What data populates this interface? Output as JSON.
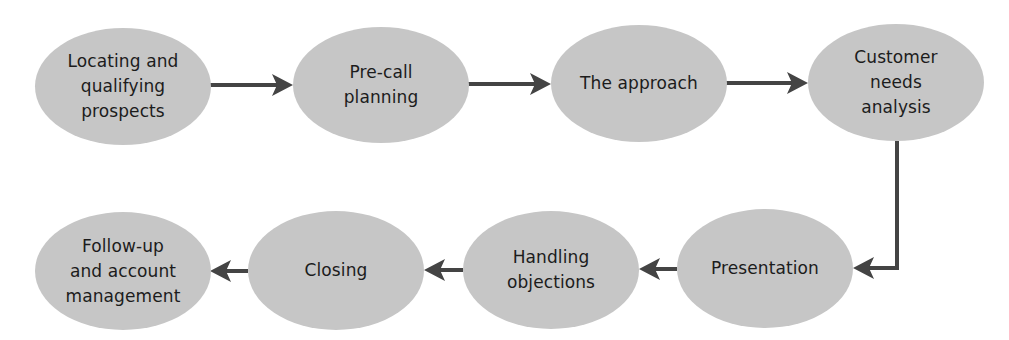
{
  "diagram": {
    "type": "process-flow",
    "colors": {
      "node_fill": "#c6c6c6",
      "arrow": "#444444",
      "text": "#1c1c1c",
      "background": "#ffffff"
    },
    "nodes": [
      {
        "id": "locating",
        "label": "Locating and\nqualifying\nprospects",
        "order": 1
      },
      {
        "id": "precall",
        "label": "Pre-call\nplanning",
        "order": 2
      },
      {
        "id": "approach",
        "label": "The approach",
        "order": 3
      },
      {
        "id": "needs",
        "label": "Customer\nneeds\nanalysis",
        "order": 4
      },
      {
        "id": "presentation",
        "label": "Presentation",
        "order": 5
      },
      {
        "id": "objections",
        "label": "Handling\nobjections",
        "order": 6
      },
      {
        "id": "closing",
        "label": "Closing",
        "order": 7
      },
      {
        "id": "followup",
        "label": "Follow-up\nand account\nmanagement",
        "order": 8
      }
    ],
    "edges": [
      {
        "from": "locating",
        "to": "precall"
      },
      {
        "from": "precall",
        "to": "approach"
      },
      {
        "from": "approach",
        "to": "needs"
      },
      {
        "from": "needs",
        "to": "presentation"
      },
      {
        "from": "presentation",
        "to": "objections"
      },
      {
        "from": "objections",
        "to": "closing"
      },
      {
        "from": "closing",
        "to": "followup"
      }
    ]
  }
}
